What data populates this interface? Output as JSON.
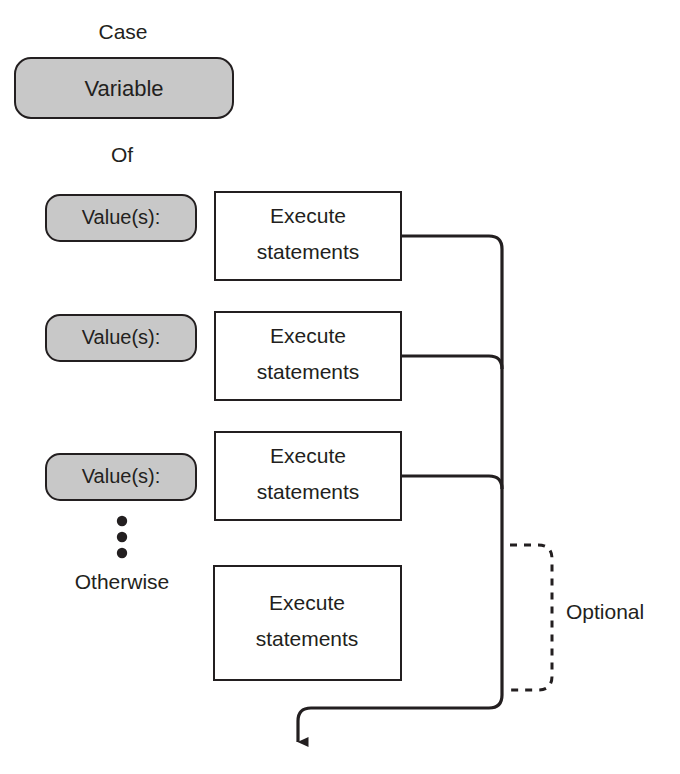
{
  "diagram": {
    "kind": "flowchart",
    "title_text": "Case structure flowchart",
    "colors": {
      "shape_fill_gray": "#c8c8c8",
      "shape_fill_white": "#ffffff",
      "stroke": "#231f20",
      "text": "#231f20",
      "background": "#ffffff"
    },
    "labels": {
      "case": "Case",
      "of": "Of",
      "otherwise": "Otherwise",
      "optional": "Optional",
      "ellipsis": "⋮"
    },
    "selector": {
      "variable": "Variable"
    },
    "branches": [
      {
        "condition": "Value(s):",
        "action_line1": "Execute",
        "action_line2": "statements"
      },
      {
        "condition": "Value(s):",
        "action_line1": "Execute",
        "action_line2": "statements"
      },
      {
        "condition": "Value(s):",
        "action_line1": "Execute",
        "action_line2": "statements"
      }
    ],
    "default_branch": {
      "condition": "Otherwise",
      "action_line1": "Execute",
      "action_line2": "statements"
    }
  }
}
